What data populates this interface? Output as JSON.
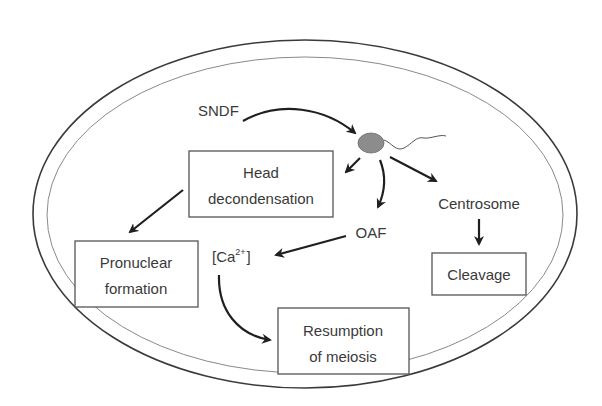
{
  "diagram": {
    "type": "flow diagram (fertilization events inside oocyte)",
    "colors": {
      "outline": "#555555",
      "text": "#3a3a3a",
      "arrow": "#1f1f1f",
      "sperm_head": "#8c8c8c"
    },
    "nodes": {
      "sndf": "SNDF",
      "sperm": "sperm",
      "head_decondensation": [
        "Head",
        "decondensation"
      ],
      "pronuclear_formation": [
        "Pronuclear",
        "formation"
      ],
      "oaf": "OAF",
      "calcium": {
        "base": "[Ca",
        "sup": "2+",
        "close": "]"
      },
      "centrosome": "Centrosome",
      "cleavage": "Cleavage",
      "resumption_of_meiosis": [
        "Resumption",
        "of meiosis"
      ]
    },
    "edges": [
      {
        "from": "SNDF",
        "to": "sperm"
      },
      {
        "from": "sperm",
        "to": "Head decondensation"
      },
      {
        "from": "sperm",
        "to": "OAF"
      },
      {
        "from": "sperm",
        "to": "Centrosome"
      },
      {
        "from": "Head decondensation",
        "to": "Pronuclear formation"
      },
      {
        "from": "OAF",
        "to": "[Ca2+]"
      },
      {
        "from": "[Ca2+]",
        "to": "Resumption of meiosis"
      },
      {
        "from": "Centrosome",
        "to": "Cleavage"
      }
    ]
  }
}
